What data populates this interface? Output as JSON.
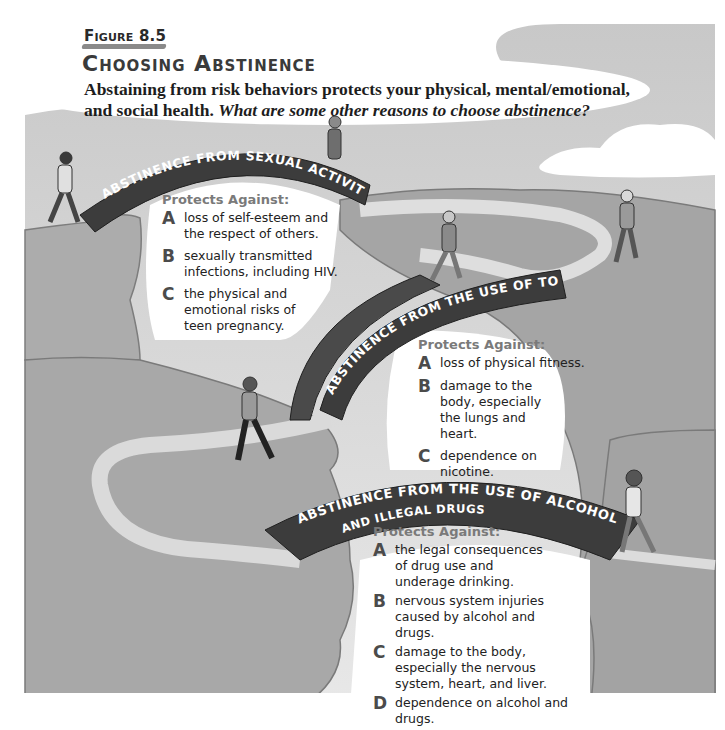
{
  "figure": {
    "label": "Figure 8.5",
    "title": "Choosing Abstinence",
    "caption_bold": "Abstaining from risk behaviors protects your physical, mental/emotional, and social health.",
    "caption_question": "What are some other reasons to choose abstinence?"
  },
  "bridges": [
    {
      "banner": "ABSTINENCE FROM SEXUAL ACTIVITY",
      "protects_header": "Protects Against:",
      "items": [
        {
          "letter": "A",
          "text": "loss of self-esteem and the respect of others."
        },
        {
          "letter": "B",
          "text": "sexually transmitted infections, including HIV."
        },
        {
          "letter": "C",
          "text": "the physical and emotional risks of teen pregnancy."
        }
      ]
    },
    {
      "banner": "ABSTINENCE FROM THE USE OF TOBACCO",
      "protects_header": "Protects Against:",
      "items": [
        {
          "letter": "A",
          "text": "loss of physical fitness."
        },
        {
          "letter": "B",
          "text": "damage to the body, especially the lungs and heart."
        },
        {
          "letter": "C",
          "text": "dependence on nicotine."
        }
      ]
    },
    {
      "banner": "ABSTINENCE FROM THE USE OF ALCOHOL",
      "banner_line2": "AND ILLEGAL DRUGS",
      "protects_header": "Protects Against:",
      "items": [
        {
          "letter": "A",
          "text": "the legal consequences of drug use and underage drinking."
        },
        {
          "letter": "B",
          "text": "nervous system injuries caused by alcohol and drugs."
        },
        {
          "letter": "C",
          "text": "damage to the body, especially the nervous system, heart, and liver."
        },
        {
          "letter": "D",
          "text": "dependence on alcohol and drugs."
        }
      ]
    }
  ],
  "colors": {
    "sky": "#d4d4d4",
    "cliff": "#a9a9a9",
    "cliff_dark": "#8f8f8f",
    "path": "#e3e3e3",
    "banner": "#3c3c3c",
    "white": "#ffffff"
  }
}
